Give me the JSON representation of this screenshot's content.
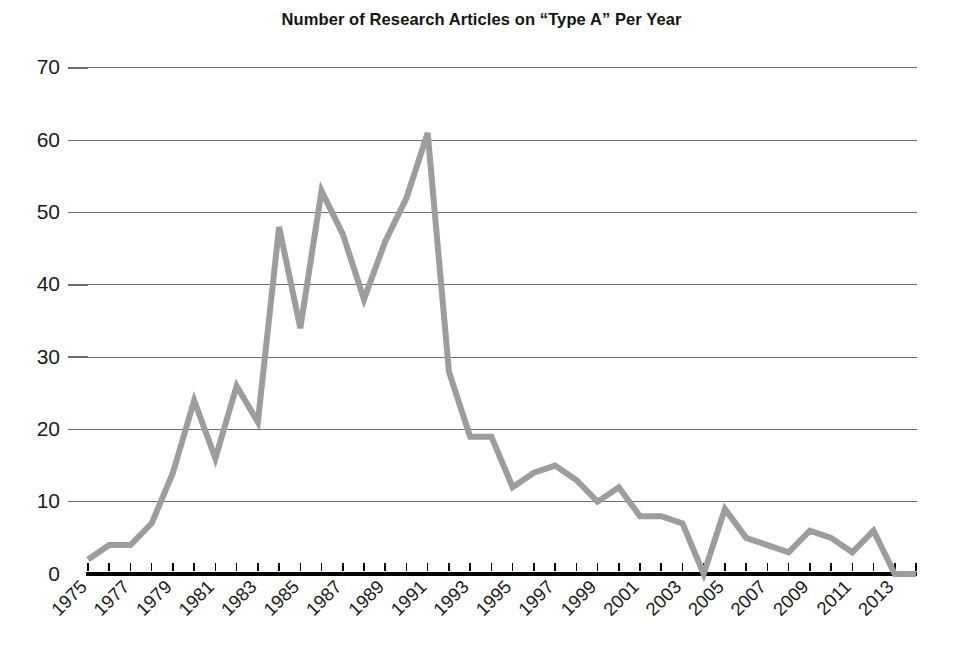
{
  "chart_data": {
    "type": "line",
    "title": "Number of Research Articles on “Type A” Per Year",
    "xlabel": "",
    "ylabel": "",
    "xlim": [
      1975,
      2014
    ],
    "ylim": [
      0,
      70
    ],
    "yticks": [
      0,
      10,
      20,
      30,
      40,
      50,
      60,
      70
    ],
    "ytick_labels": [
      "0",
      "10",
      "20",
      "30",
      "40",
      "50",
      "60",
      "70"
    ],
    "xticks": [
      1975,
      1977,
      1979,
      1981,
      1983,
      1985,
      1987,
      1989,
      1991,
      1993,
      1995,
      1997,
      1999,
      2001,
      2003,
      2005,
      2007,
      2009,
      2011,
      2013
    ],
    "xtick_labels": [
      "1975",
      "1977",
      "1979",
      "1981",
      "1983",
      "1985",
      "1987",
      "1989",
      "1991",
      "1993",
      "1995",
      "1997",
      "1999",
      "2001",
      "2003",
      "2005",
      "2007",
      "2009",
      "2011",
      "2013"
    ],
    "xtick_label_rotation": -45,
    "grid": "horizontal",
    "legend": "none",
    "series": [
      {
        "name": "Research articles",
        "color": "#9d9d9d",
        "line_width": 6,
        "x": [
          1975,
          1976,
          1977,
          1978,
          1979,
          1980,
          1981,
          1982,
          1983,
          1984,
          1985,
          1986,
          1987,
          1988,
          1989,
          1990,
          1991,
          1992,
          1993,
          1994,
          1995,
          1996,
          1997,
          1998,
          1999,
          2000,
          2001,
          2002,
          2003,
          2004,
          2005,
          2006,
          2007,
          2008,
          2009,
          2010,
          2011,
          2012,
          2013,
          2014
        ],
        "values": [
          2,
          4,
          4,
          7,
          14,
          24,
          16,
          26,
          21,
          48,
          34,
          53,
          47,
          38,
          46,
          52,
          61,
          28,
          19,
          19,
          12,
          14,
          15,
          13,
          10,
          12,
          8,
          8,
          7,
          0,
          9,
          5,
          4,
          3,
          6,
          5,
          3,
          6,
          0,
          0
        ]
      }
    ]
  },
  "axis": {
    "y_axis_name": "y-axis",
    "x_axis_name": "x-axis"
  }
}
